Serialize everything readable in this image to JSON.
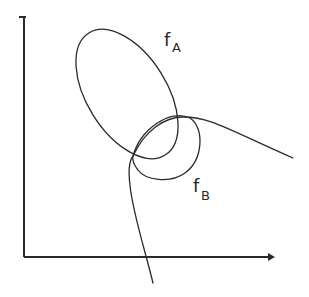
{
  "diagram": {
    "axes": {
      "x_axis": {
        "label": "",
        "arrow": true
      },
      "y_axis": {
        "label": "",
        "arrow": true
      }
    },
    "curves": [
      {
        "id": "fA",
        "label_main": "f",
        "label_sub": "A",
        "shape": "ellipse"
      },
      {
        "id": "fB",
        "label_main": "f",
        "label_sub": "B",
        "shape": "looped curve"
      }
    ],
    "colors": {
      "ink": "#2a2a2a",
      "background": "#ffffff"
    }
  }
}
